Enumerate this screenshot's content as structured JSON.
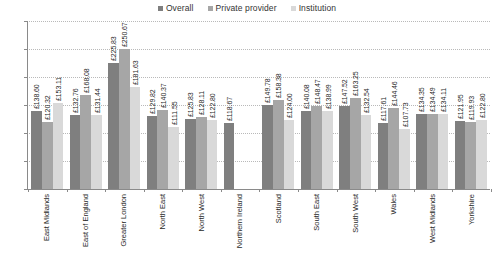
{
  "chart_data": {
    "type": "bar",
    "title": "",
    "xlabel": "",
    "ylabel": "",
    "ylim": [
      0,
      300
    ],
    "ytick_labels": [
      "£0",
      "£50",
      "£100",
      "£150",
      "£200",
      "£250",
      "£300"
    ],
    "ytick_values": [
      0,
      50,
      100,
      150,
      200,
      250,
      300
    ],
    "grid": true,
    "legend_position": "top-center",
    "categories": [
      "East Midlands",
      "East of England",
      "Greater London",
      "North East",
      "North West",
      "Northern Ireland",
      "Scotland",
      "South East",
      "South West",
      "Wales",
      "West Midlands",
      "Yorkshire"
    ],
    "series": [
      {
        "name": "Overall",
        "color": "#7f7f7f",
        "values": [
          138.6,
          132.76,
          225.83,
          129.82,
          125.83,
          118.67,
          149.78,
          140.08,
          147.52,
          117.61,
          134.35,
          121.95
        ],
        "labels": [
          "£138.60",
          "£132.76",
          "£225.83",
          "£129.82",
          "£125.83",
          "£118.67",
          "£149.78",
          "£140.08",
          "£147.52",
          "£117.61",
          "£134.35",
          "£121.95"
        ]
      },
      {
        "name": "Private provider",
        "color": "#a6a6a6",
        "values": [
          120.32,
          168.08,
          250.67,
          140.37,
          128.11,
          null,
          158.38,
          148.47,
          163.25,
          144.46,
          134.49,
          119.93
        ],
        "labels": [
          "£120.32",
          "£168.08",
          "£250.67",
          "£140.37",
          "£128.11",
          "",
          "£158.38",
          "£148.47",
          "£163.25",
          "£144.46",
          "£134.49",
          "£119.93"
        ]
      },
      {
        "name": "Institution",
        "color": "#d9d9d9",
        "values": [
          153.11,
          131.44,
          181.63,
          111.55,
          122.8,
          null,
          124.0,
          138.99,
          132.54,
          107.73,
          134.11,
          122.8
        ],
        "labels": [
          "£153.11",
          "£131.44",
          "£181.63",
          "£111.55",
          "£122.80",
          "",
          "£124.00",
          "£138.99",
          "£132.54",
          "£107.73",
          "£134.11",
          "£122.80"
        ]
      }
    ]
  },
  "legend": {
    "items": [
      {
        "label": "Overall",
        "color": "#7f7f7f"
      },
      {
        "label": "Private provider",
        "color": "#a6a6a6"
      },
      {
        "label": "Institution",
        "color": "#d9d9d9"
      }
    ]
  }
}
